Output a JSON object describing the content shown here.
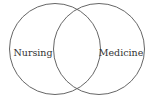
{
  "diagram": {
    "type": "venn",
    "sets": [
      {
        "label": "Nursing",
        "cx": 55,
        "cy": 49,
        "r": 46
      },
      {
        "label": "Medicine",
        "cx": 99,
        "cy": 49,
        "r": 46
      }
    ],
    "stroke_color": "#666666"
  }
}
